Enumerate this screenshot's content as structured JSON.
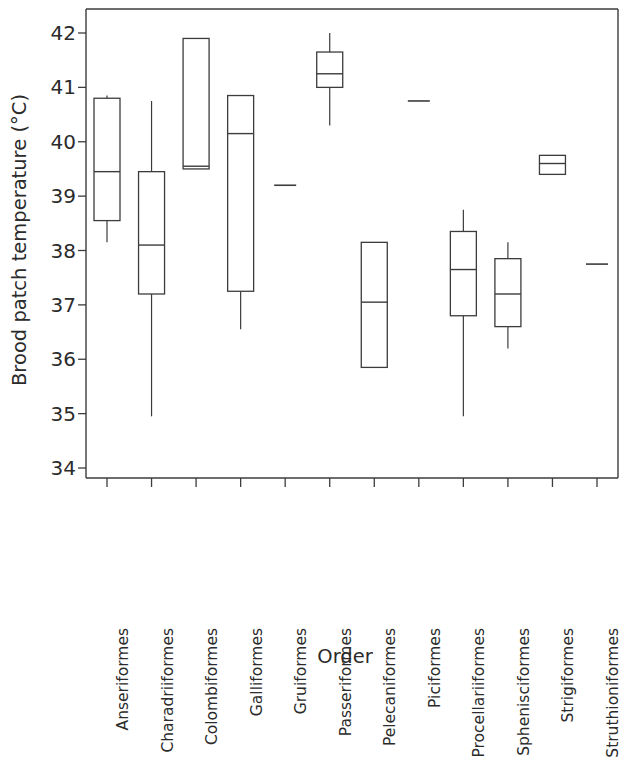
{
  "chart_data": {
    "type": "box",
    "title": "",
    "xlabel": "Order",
    "ylabel": "Brood patch temperature (°C)",
    "ylim": [
      34,
      42.4
    ],
    "yticks": [
      34,
      35,
      36,
      37,
      38,
      39,
      40,
      41,
      42
    ],
    "ytick_labels": [
      "34",
      "35",
      "36",
      "37",
      "38",
      "39",
      "40",
      "41",
      "42"
    ],
    "grid": false,
    "legend": null,
    "categories": [
      "Anseriformes",
      "Charadriiformes",
      "Colombiformes",
      "Galliformes",
      "Gruiformes",
      "Passeriformes",
      "Pelecaniformes",
      "Piciformes",
      "Procellariiformes",
      "Sphenisciformes",
      "Strigiformes",
      "Struthioniformes"
    ],
    "boxes": [
      {
        "category": "Anseriformes",
        "whisker_low": 38.15,
        "q1": 38.55,
        "median": 39.45,
        "q3": 40.8,
        "whisker_high": 40.85,
        "single_value": null
      },
      {
        "category": "Charadriiformes",
        "whisker_low": 34.95,
        "q1": 37.2,
        "median": 38.1,
        "q3": 39.45,
        "whisker_high": 40.75,
        "single_value": null
      },
      {
        "category": "Colombiformes",
        "whisker_low": 39.5,
        "q1": 39.5,
        "median": 39.55,
        "q3": 41.9,
        "whisker_high": 41.9,
        "single_value": null
      },
      {
        "category": "Galliformes",
        "whisker_low": 36.55,
        "q1": 37.25,
        "median": 40.15,
        "q3": 40.85,
        "whisker_high": 40.85,
        "single_value": null
      },
      {
        "category": "Gruiformes",
        "whisker_low": null,
        "q1": null,
        "median": null,
        "q3": null,
        "whisker_high": null,
        "single_value": 39.2
      },
      {
        "category": "Passeriformes",
        "whisker_low": 40.3,
        "q1": 41.0,
        "median": 41.25,
        "q3": 41.65,
        "whisker_high": 42.0,
        "single_value": null
      },
      {
        "category": "Pelecaniformes",
        "whisker_low": 35.85,
        "q1": 35.85,
        "median": 37.05,
        "q3": 38.15,
        "whisker_high": 38.15,
        "single_value": null
      },
      {
        "category": "Piciformes",
        "whisker_low": null,
        "q1": null,
        "median": null,
        "q3": null,
        "whisker_high": null,
        "single_value": 40.75
      },
      {
        "category": "Procellariiformes",
        "whisker_low": 34.95,
        "q1": 36.8,
        "median": 37.65,
        "q3": 38.35,
        "whisker_high": 38.75,
        "single_value": null
      },
      {
        "category": "Sphenisciformes",
        "whisker_low": 36.2,
        "q1": 36.6,
        "median": 37.2,
        "q3": 37.85,
        "whisker_high": 38.15,
        "single_value": null
      },
      {
        "category": "Strigiformes",
        "whisker_low": 39.4,
        "q1": 39.4,
        "median": 39.6,
        "q3": 39.75,
        "whisker_high": 39.75,
        "single_value": null
      },
      {
        "category": "Struthioniformes",
        "whisker_low": null,
        "q1": null,
        "median": null,
        "q3": null,
        "whisker_high": null,
        "single_value": 37.75
      }
    ],
    "colors": {
      "stroke": "#3c3c3c",
      "text": "#2b2b2b",
      "background": "#ffffff"
    }
  }
}
